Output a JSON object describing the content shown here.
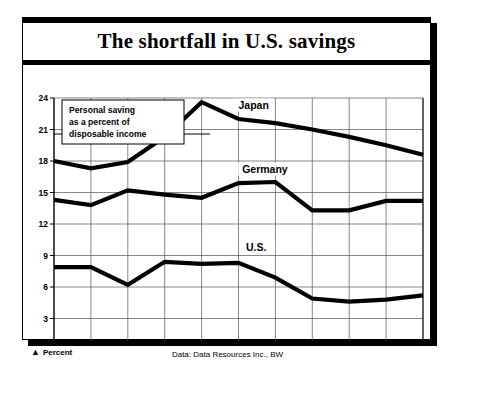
{
  "figure": {
    "title": "The shortfall in U.S. savings",
    "annotation": {
      "line1": "Personal saving",
      "line2": "as a percent of",
      "line3": "disposable income"
    },
    "footer": {
      "unit_marker": "▲",
      "unit_label": "Percent",
      "source": "Data: Data Resources Inc., BW"
    }
  },
  "chart_data": {
    "type": "line",
    "title": "The shortfall in U.S. savings",
    "xlabel": "",
    "ylabel": "Percent",
    "ylim": [
      0,
      24
    ],
    "xlim": [
      1970,
      1980
    ],
    "yticks": [
      0,
      3,
      6,
      9,
      12,
      15,
      18,
      21,
      24
    ],
    "grid": true,
    "legend": "inline-labels",
    "annotation": "Personal saving as a percent of disposable income",
    "source": "Data: Data Resources Inc., BW",
    "categories": [
      "1970",
      "1971",
      "1972",
      "1973",
      "1974",
      "1975",
      "1976",
      "1977",
      "1978",
      "1979",
      "1980"
    ],
    "x": [
      1970,
      1971,
      1972,
      1973,
      1974,
      1975,
      1976,
      1977,
      1978,
      1979,
      1980
    ],
    "series": [
      {
        "name": "Japan",
        "color": "#000000",
        "values": [
          18.0,
          17.3,
          17.9,
          20.3,
          23.6,
          22.0,
          21.6,
          21.0,
          20.3,
          19.5,
          18.6
        ]
      },
      {
        "name": "Germany",
        "color": "#000000",
        "values": [
          14.3,
          13.8,
          15.2,
          14.8,
          14.5,
          15.9,
          16.0,
          13.3,
          13.3,
          14.2,
          14.2
        ]
      },
      {
        "name": "U.S.",
        "color": "#000000",
        "values": [
          7.9,
          7.9,
          6.2,
          8.4,
          8.2,
          8.3,
          6.9,
          4.9,
          4.6,
          4.8,
          5.2
        ]
      }
    ]
  }
}
